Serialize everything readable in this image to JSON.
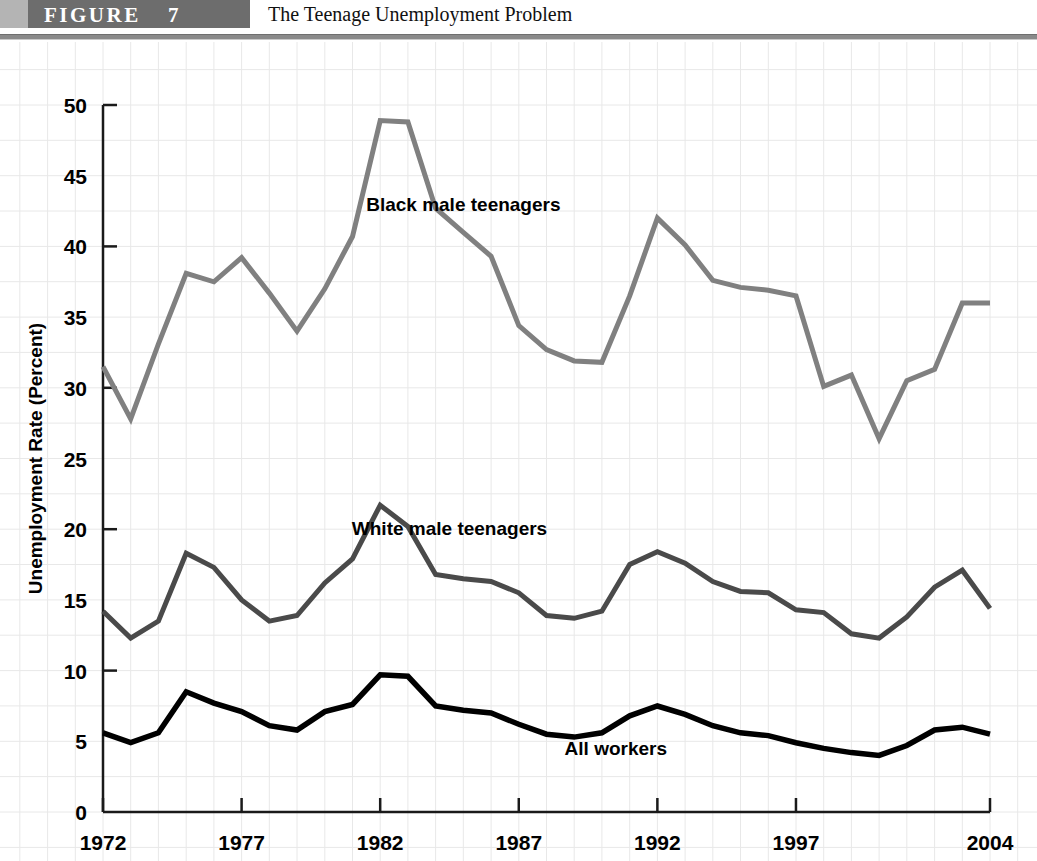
{
  "header": {
    "figure_word": "FIGURE",
    "figure_number": "7",
    "title": "The Teenage Unemployment Problem"
  },
  "chart_data": {
    "type": "line",
    "title": "The Teenage Unemployment Problem",
    "xlabel": "",
    "ylabel": "Unemployment Rate (Percent)",
    "xlim": [
      1972,
      2004
    ],
    "ylim": [
      0,
      50
    ],
    "ytick_step": 5,
    "yticks": [
      "0",
      "5",
      "10",
      "15",
      "20",
      "25",
      "30",
      "35",
      "40",
      "45",
      "50"
    ],
    "xticks": [
      "1972",
      "1977",
      "1982",
      "1987",
      "1992",
      "1997",
      "2004"
    ],
    "xtick_values": [
      1972,
      1977,
      1982,
      1987,
      1992,
      1997,
      2004
    ],
    "grid": true,
    "grid_color": "#e8e8e8",
    "legend_position": "inline-annotations",
    "x": [
      1972,
      1973,
      1974,
      1975,
      1976,
      1977,
      1978,
      1979,
      1980,
      1981,
      1982,
      1983,
      1984,
      1985,
      1986,
      1987,
      1988,
      1989,
      1990,
      1991,
      1992,
      1993,
      1994,
      1995,
      1996,
      1997,
      1998,
      1999,
      2000,
      2001,
      2002,
      2003,
      2004
    ],
    "series": [
      {
        "name": "Black male teenagers",
        "color": "#808080",
        "label_x": 1985,
        "label_y": 42.5,
        "values": [
          31.5,
          27.8,
          33.1,
          38.1,
          37.5,
          39.2,
          36.7,
          34.0,
          37.0,
          40.7,
          48.9,
          48.8,
          42.7,
          41.0,
          39.3,
          34.4,
          32.7,
          31.9,
          31.8,
          36.5,
          42.0,
          40.1,
          37.6,
          37.1,
          36.9,
          36.5,
          30.1,
          30.9,
          26.4,
          30.5,
          31.3,
          36.0,
          36.0
        ]
      },
      {
        "name": "White male teenagers",
        "color": "#4a4a4a",
        "label_x": 1984.5,
        "label_y": 19.6,
        "values": [
          14.2,
          12.3,
          13.5,
          18.3,
          17.3,
          15.0,
          13.5,
          13.9,
          16.2,
          17.9,
          21.7,
          20.2,
          16.8,
          16.5,
          16.3,
          15.5,
          13.9,
          13.7,
          14.2,
          17.5,
          18.4,
          17.6,
          16.3,
          15.6,
          15.5,
          14.3,
          14.1,
          12.6,
          12.3,
          13.8,
          15.9,
          17.1,
          14.4
        ]
      },
      {
        "name": "All workers",
        "color": "#000000",
        "label_x": 1990.5,
        "label_y": 4.0,
        "values": [
          5.6,
          4.9,
          5.6,
          8.5,
          7.7,
          7.1,
          6.1,
          5.8,
          7.1,
          7.6,
          9.7,
          9.6,
          7.5,
          7.2,
          7.0,
          6.2,
          5.5,
          5.3,
          5.6,
          6.8,
          7.5,
          6.9,
          6.1,
          5.6,
          5.4,
          4.9,
          4.5,
          4.2,
          4.0,
          4.7,
          5.8,
          6.0,
          5.5
        ]
      }
    ]
  }
}
